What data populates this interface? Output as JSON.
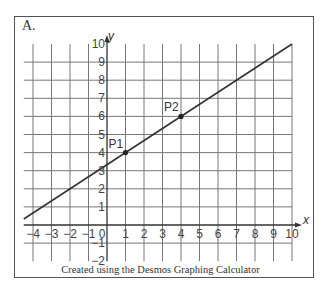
{
  "panel_label": "A.",
  "credit": "Created using the Desmos Graphing Calculator",
  "colors": {
    "grid": "#777777",
    "axis": "#333333",
    "line": "#333333",
    "text": "#444444"
  },
  "chart_data": {
    "type": "line",
    "title": "",
    "panel": "A.",
    "xlabel": "x",
    "ylabel": "y",
    "xlim": [
      -4.5,
      10
    ],
    "ylim": [
      -2,
      10
    ],
    "grid": true,
    "x_ticks": [
      -4,
      -3,
      -2,
      -1,
      0,
      1,
      2,
      3,
      4,
      5,
      6,
      7,
      8,
      9,
      10
    ],
    "y_ticks": [
      -2,
      -1,
      1,
      2,
      3,
      4,
      5,
      6,
      7,
      8,
      9,
      10
    ],
    "series": [
      {
        "name": "line through P1 and P2",
        "equation": "y = (2/3)x + 10/3",
        "x": [
          -4.5,
          10
        ],
        "y": [
          0.33,
          10
        ]
      }
    ],
    "points": [
      {
        "label": "P1",
        "x": 1,
        "y": 4
      },
      {
        "label": "P2",
        "x": 4,
        "y": 6
      }
    ],
    "annotation": "Created using the Desmos Graphing Calculator"
  }
}
